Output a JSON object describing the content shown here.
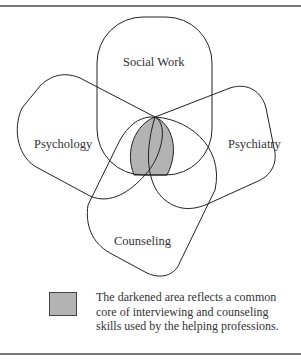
{
  "diagram": {
    "type": "venn",
    "sets": [
      {
        "id": "social-work",
        "label": "Social Work"
      },
      {
        "id": "psychology",
        "label": "Psychology"
      },
      {
        "id": "psychiatry",
        "label": "Psychiatry"
      },
      {
        "id": "counseling",
        "label": "Counseling"
      }
    ],
    "shaded_region": "intersection of all four",
    "colors": {
      "outline": "#222222",
      "shaded": "#b3b3b3",
      "rule": "#777777"
    }
  },
  "legend": {
    "swatch_color": "#b3b3b3",
    "text": "The darkened area reflects a common core of interviewing and counseling skills used by the helping professions."
  }
}
